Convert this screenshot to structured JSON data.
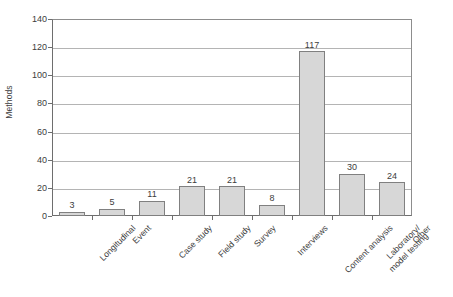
{
  "chart_data": {
    "type": "bar",
    "title": "",
    "xlabel": "",
    "ylabel": "Methods",
    "categories": [
      "Longitudinal",
      "Event",
      "Case study",
      "Field study",
      "Survey",
      "Interviews",
      "Content analysis",
      "Laboratory/ model testing",
      "Other"
    ],
    "category_lines": [
      [
        "Longitudinal"
      ],
      [
        "Event"
      ],
      [
        "Case study"
      ],
      [
        "Field study"
      ],
      [
        "Survey"
      ],
      [
        "Interviews"
      ],
      [
        "Content analysis"
      ],
      [
        "Laboratory/",
        "model testing"
      ],
      [
        "Other"
      ]
    ],
    "values": [
      3,
      5,
      11,
      21,
      21,
      8,
      117,
      30,
      24
    ],
    "data_labels": [
      "3",
      "5",
      "11",
      "21",
      "21",
      "8",
      "117",
      "30",
      "24"
    ],
    "ylim": [
      0,
      140
    ],
    "ytick_values": [
      0,
      20,
      40,
      60,
      80,
      100,
      120,
      140
    ],
    "ytick_labels": [
      "0",
      "20",
      "40",
      "60",
      "80",
      "100",
      "120",
      "140"
    ],
    "grid": "horizontal",
    "legend": "none",
    "bar_fill_color": "#d7d7d7",
    "bar_border_color": "#808080",
    "gridline_color": "#b4b4b4",
    "axis_color": "#6e6e6e",
    "text_color": "#3d3d3d",
    "background_color": "#ffffff",
    "x_label_rotation_deg": -45
  }
}
